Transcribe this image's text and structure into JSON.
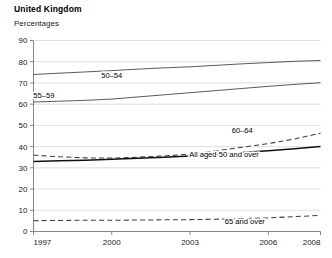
{
  "header": {
    "title": "United Kingdom",
    "subtitle": "Percentages"
  },
  "chart_data": {
    "type": "line",
    "title": "United Kingdom",
    "subtitle": "Percentages",
    "xlabel": "",
    "ylabel": "",
    "xlim": [
      1997,
      2008
    ],
    "ylim": [
      0,
      90
    ],
    "ytick_step": 10,
    "grid": true,
    "legend": "inline-labels",
    "x": [
      1997,
      1998,
      1999,
      2000,
      2001,
      2002,
      2003,
      2004,
      2005,
      2006,
      2007,
      2008
    ],
    "xtick_labels": [
      "1997",
      "2000",
      "2003",
      "2006",
      "2008"
    ],
    "xtick_values": [
      1997,
      2000,
      2003,
      2006,
      2008
    ],
    "ytick_labels": [
      "0",
      "10",
      "20",
      "30",
      "40",
      "50",
      "60",
      "70",
      "80",
      "90"
    ],
    "ytick_values": [
      0,
      10,
      20,
      30,
      40,
      50,
      60,
      70,
      80,
      90
    ],
    "series": [
      {
        "name": "50–54",
        "style": "solid",
        "values": [
          74.0,
          74.6,
          75.2,
          75.8,
          76.5,
          77.1,
          77.6,
          78.3,
          79.0,
          79.6,
          80.2,
          80.6
        ]
      },
      {
        "name": "55–59",
        "style": "solid",
        "values": [
          61.0,
          61.4,
          61.8,
          62.4,
          63.4,
          64.4,
          65.4,
          66.4,
          67.4,
          68.4,
          69.3,
          70.1
        ]
      },
      {
        "name": "60–64",
        "style": "dashed",
        "values": [
          36.0,
          35.2,
          34.7,
          34.6,
          35.0,
          35.6,
          36.4,
          38.0,
          39.7,
          41.4,
          43.6,
          46.3
        ]
      },
      {
        "name": "All aged 50 and over",
        "style": "solid-bold",
        "values": [
          33.0,
          33.3,
          33.6,
          34.0,
          34.5,
          35.0,
          35.6,
          36.4,
          37.2,
          38.0,
          39.0,
          40.0
        ]
      },
      {
        "name": "65 and over",
        "style": "dashed",
        "values": [
          5.1,
          5.2,
          5.3,
          5.3,
          5.4,
          5.5,
          5.6,
          5.8,
          6.1,
          6.4,
          7.0,
          7.6
        ]
      }
    ],
    "series_label_positions": [
      {
        "name": "50–54",
        "x": 2000.0,
        "y": 72.3
      },
      {
        "name": "55–59",
        "x": 1997.4,
        "y": 62.8
      },
      {
        "name": "60–64",
        "x": 2005.0,
        "y": 46.2
      },
      {
        "name": "All aged 50 and over",
        "x": 2004.3,
        "y": 35.0
      },
      {
        "name": "65 and over",
        "x": 2005.1,
        "y": 3.4
      }
    ]
  },
  "colors": {
    "background": "#ffffff",
    "text": "#1a1a1a",
    "gridline": "#c9c9c9",
    "axis": "#7a7a7a",
    "series_line": "#3c3c3c",
    "series_line_bold": "#111111"
  }
}
